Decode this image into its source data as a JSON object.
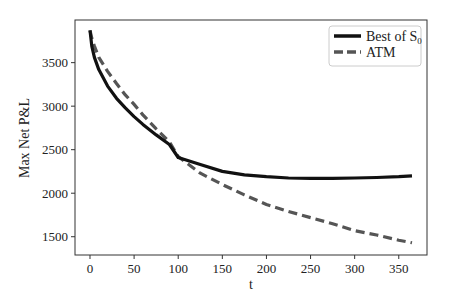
{
  "chart_data": {
    "type": "line",
    "title": "",
    "xlabel": "t",
    "ylabel": "Max Net P&L",
    "xlim": [
      -17,
      382
    ],
    "ylim": [
      1290,
      3990
    ],
    "xticks": [
      0,
      50,
      100,
      150,
      200,
      250,
      300,
      350
    ],
    "xtick_labels": [
      "0",
      "50",
      "100",
      "150",
      "200",
      "250",
      "300",
      "350"
    ],
    "yticks": [
      1500,
      2000,
      2500,
      3000,
      3500
    ],
    "ytick_labels": [
      "1500",
      "2000",
      "2500",
      "3000",
      "3500"
    ],
    "grid": false,
    "legend_position": "upper right",
    "x": [
      0,
      2,
      5,
      10,
      20,
      30,
      40,
      50,
      60,
      75,
      90,
      100,
      125,
      150,
      175,
      200,
      225,
      250,
      275,
      300,
      325,
      350,
      365
    ],
    "series": [
      {
        "name": "Best of S0",
        "legend_label_main": "Best of S",
        "legend_label_sub": "0",
        "style": "solid",
        "color": "#111111",
        "values": [
          3870,
          3690,
          3560,
          3420,
          3230,
          3090,
          2980,
          2880,
          2790,
          2670,
          2560,
          2410,
          2330,
          2250,
          2210,
          2190,
          2175,
          2170,
          2170,
          2175,
          2180,
          2190,
          2200
        ]
      },
      {
        "name": "ATM",
        "legend_label_main": "ATM",
        "legend_label_sub": "",
        "style": "dashed",
        "color": "#555555",
        "values": [
          3870,
          3780,
          3690,
          3560,
          3400,
          3260,
          3130,
          3020,
          2900,
          2740,
          2590,
          2420,
          2230,
          2100,
          1980,
          1870,
          1790,
          1720,
          1650,
          1570,
          1520,
          1460,
          1430
        ]
      }
    ]
  }
}
